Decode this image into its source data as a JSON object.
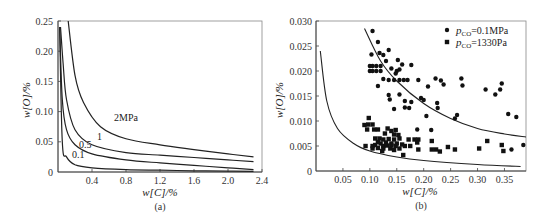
{
  "chart_data": [
    {
      "id": "a",
      "type": "line",
      "caption": "(a)",
      "title": "",
      "xlabel": "w[C]/%",
      "ylabel": "w[O]/%",
      "xlim": [
        0,
        2.4
      ],
      "ylim": [
        0,
        0.25
      ],
      "x_ticks": [
        "0.4",
        "0.8",
        "1.2",
        "1.6",
        "2.0",
        "2.4"
      ],
      "y_ticks": [
        "0",
        "0.05",
        "0.10",
        "0.15",
        "0.20",
        "0.25"
      ],
      "grid": false,
      "series": [
        {
          "name": "0.1",
          "label": "0.1",
          "x": [
            0.02,
            0.05,
            0.1,
            0.2,
            0.4,
            0.8,
            1.2,
            1.6,
            2.0,
            2.3
          ],
          "values": [
            0.24,
            0.05,
            0.025,
            0.012,
            0.007,
            0.004,
            0.003,
            0.002,
            0.0015,
            0.001
          ]
        },
        {
          "name": "0.5",
          "label": "0.5",
          "x": [
            0.02,
            0.05,
            0.1,
            0.2,
            0.4,
            0.8,
            1.2,
            1.6,
            2.0,
            2.3
          ],
          "values": [
            0.24,
            0.12,
            0.07,
            0.045,
            0.03,
            0.02,
            0.015,
            0.011,
            0.007,
            0.004
          ]
        },
        {
          "name": "1",
          "label": "1",
          "x": [
            0.03,
            0.06,
            0.1,
            0.2,
            0.4,
            0.8,
            1.2,
            1.6,
            2.0,
            2.3
          ],
          "values": [
            0.24,
            0.18,
            0.12,
            0.07,
            0.045,
            0.032,
            0.028,
            0.024,
            0.02,
            0.017
          ]
        },
        {
          "name": "2MPa",
          "label": "2MPa",
          "x": [
            0.12,
            0.2,
            0.3,
            0.5,
            0.8,
            1.2,
            1.6,
            2.0,
            2.3
          ],
          "values": [
            0.25,
            0.16,
            0.115,
            0.075,
            0.055,
            0.045,
            0.037,
            0.03,
            0.025
          ]
        }
      ]
    },
    {
      "id": "b",
      "type": "scatter",
      "caption": "(b)",
      "title": "",
      "xlabel": "w[C]/%",
      "ylabel": "w[O]/%",
      "xlim": [
        0,
        0.39
      ],
      "ylim": [
        0,
        0.03
      ],
      "x_ticks": [
        "0.05",
        "0.10",
        "0.15",
        "0.20",
        "0.25",
        "0.30",
        "0.35"
      ],
      "y_ticks": [
        "0",
        "0.005",
        "0.010",
        "0.015",
        "0.020",
        "0.025",
        "0.030"
      ],
      "grid": false,
      "legend": {
        "position": "upper right",
        "entries": [
          {
            "marker": "circle",
            "prefix": "p",
            "subscript": "CO",
            "text": "=0.1MPa"
          },
          {
            "marker": "square",
            "prefix": "p",
            "subscript": "CO",
            "text": "=1330Pa"
          }
        ]
      },
      "series": [
        {
          "name": "pCO=0.1MPa",
          "marker": "circle",
          "points": [
            [
              0.105,
              0.028
            ],
            [
              0.115,
              0.0258
            ],
            [
              0.103,
              0.0233
            ],
            [
              0.118,
              0.0236
            ],
            [
              0.125,
              0.0232
            ],
            [
              0.135,
              0.0242
            ],
            [
              0.13,
              0.022
            ],
            [
              0.152,
              0.0222
            ],
            [
              0.16,
              0.0213
            ],
            [
              0.177,
              0.0212
            ],
            [
              0.1,
              0.021
            ],
            [
              0.105,
              0.021
            ],
            [
              0.112,
              0.021
            ],
            [
              0.12,
              0.021
            ],
            [
              0.14,
              0.0205
            ],
            [
              0.15,
              0.02
            ],
            [
              0.155,
              0.0203
            ],
            [
              0.1,
              0.02
            ],
            [
              0.105,
              0.02
            ],
            [
              0.112,
              0.02
            ],
            [
              0.12,
              0.02
            ],
            [
              0.148,
              0.0195
            ],
            [
              0.125,
              0.0184
            ],
            [
              0.135,
              0.0182
            ],
            [
              0.145,
              0.0182
            ],
            [
              0.155,
              0.0182
            ],
            [
              0.163,
              0.0182
            ],
            [
              0.17,
              0.0182
            ],
            [
              0.19,
              0.0182
            ],
            [
              0.222,
              0.0185
            ],
            [
              0.232,
              0.0181
            ],
            [
              0.27,
              0.0185
            ],
            [
              0.115,
              0.017
            ],
            [
              0.208,
              0.0169
            ],
            [
              0.237,
              0.0173
            ],
            [
              0.272,
              0.0171
            ],
            [
              0.345,
              0.0175
            ],
            [
              0.342,
              0.0163
            ],
            [
              0.315,
              0.0163
            ],
            [
              0.333,
              0.0153
            ],
            [
              0.135,
              0.0152
            ],
            [
              0.155,
              0.0153
            ],
            [
              0.137,
              0.0143
            ],
            [
              0.195,
              0.0146
            ],
            [
              0.2,
              0.0142
            ],
            [
              0.165,
              0.014
            ],
            [
              0.177,
              0.0138
            ],
            [
              0.145,
              0.0124
            ],
            [
              0.165,
              0.0127
            ],
            [
              0.173,
              0.0126
            ],
            [
              0.225,
              0.0136
            ],
            [
              0.226,
              0.0126
            ],
            [
              0.205,
              0.011
            ],
            [
              0.262,
              0.0112
            ],
            [
              0.258,
              0.0105
            ],
            [
              0.357,
              0.0114
            ],
            [
              0.372,
              0.0108
            ],
            [
              0.188,
              0.0083
            ],
            [
              0.214,
              0.0082
            ],
            [
              0.385,
              0.0052
            ],
            [
              0.363,
              0.0043
            ]
          ]
        },
        {
          "name": "pCO=1330Pa",
          "marker": "square",
          "points": [
            [
              0.098,
              0.0106
            ],
            [
              0.09,
              0.0092
            ],
            [
              0.097,
              0.0093
            ],
            [
              0.105,
              0.0093
            ],
            [
              0.095,
              0.0083
            ],
            [
              0.108,
              0.0083
            ],
            [
              0.115,
              0.0083
            ],
            [
              0.133,
              0.0085
            ],
            [
              0.14,
              0.008
            ],
            [
              0.148,
              0.0082
            ],
            [
              0.128,
              0.0075
            ],
            [
              0.145,
              0.0073
            ],
            [
              0.153,
              0.0072
            ],
            [
              0.11,
              0.0065
            ],
            [
              0.118,
              0.0065
            ],
            [
              0.125,
              0.0063
            ],
            [
              0.135,
              0.0064
            ],
            [
              0.145,
              0.0063
            ],
            [
              0.155,
              0.0065
            ],
            [
              0.172,
              0.0063
            ],
            [
              0.183,
              0.0063
            ],
            [
              0.19,
              0.0063
            ],
            [
              0.115,
              0.0058
            ],
            [
              0.12,
              0.0055
            ],
            [
              0.13,
              0.0057
            ],
            [
              0.14,
              0.0055
            ],
            [
              0.15,
              0.0055
            ],
            [
              0.16,
              0.0053
            ],
            [
              0.188,
              0.0057
            ],
            [
              0.215,
              0.006
            ],
            [
              0.318,
              0.006
            ],
            [
              0.092,
              0.005
            ],
            [
              0.105,
              0.005
            ],
            [
              0.11,
              0.0052
            ],
            [
              0.125,
              0.005
            ],
            [
              0.132,
              0.0051
            ],
            [
              0.14,
              0.0051
            ],
            [
              0.148,
              0.005
            ],
            [
              0.165,
              0.005
            ],
            [
              0.175,
              0.005
            ],
            [
              0.345,
              0.0052
            ],
            [
              0.105,
              0.0045
            ],
            [
              0.115,
              0.0046
            ],
            [
              0.125,
              0.0045
            ],
            [
              0.138,
              0.0045
            ],
            [
              0.155,
              0.0045
            ],
            [
              0.19,
              0.0043
            ],
            [
              0.215,
              0.0043
            ],
            [
              0.223,
              0.0043
            ],
            [
              0.23,
              0.0039
            ],
            [
              0.245,
              0.0048
            ],
            [
              0.258,
              0.0043
            ],
            [
              0.303,
              0.0045
            ],
            [
              0.348,
              0.004
            ],
            [
              0.123,
              0.004
            ],
            [
              0.145,
              0.0042
            ],
            [
              0.162,
              0.0032
            ]
          ]
        }
      ],
      "curves": [
        {
          "name": "upper-bound-curve",
          "x": [
            0.09,
            0.12,
            0.15,
            0.2,
            0.25,
            0.3,
            0.35,
            0.39
          ],
          "values": [
            0.0285,
            0.022,
            0.018,
            0.0135,
            0.0105,
            0.0085,
            0.0074,
            0.0068
          ]
        },
        {
          "name": "lower-bound-curve",
          "x": [
            0.008,
            0.02,
            0.04,
            0.07,
            0.1,
            0.15,
            0.2,
            0.3,
            0.38
          ],
          "values": [
            0.024,
            0.014,
            0.0085,
            0.0055,
            0.004,
            0.0028,
            0.0021,
            0.0013,
            0.0009
          ]
        }
      ]
    }
  ]
}
